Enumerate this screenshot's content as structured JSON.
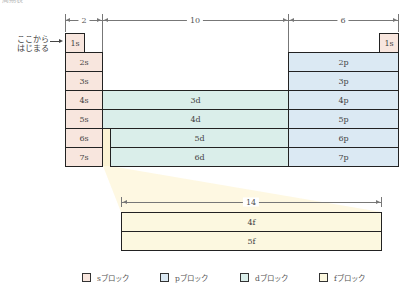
{
  "header": {
    "title": "周期表"
  },
  "dimensions": {
    "s_width": "2",
    "d_width": "10",
    "p_width": "6",
    "f_width": "14"
  },
  "start_label": {
    "line1": "ここから",
    "line2": "はじまる"
  },
  "s_block": [
    "1s",
    "2s",
    "3s",
    "4s",
    "5s",
    "6s",
    "7s"
  ],
  "p_block": {
    "top": "1s",
    "rows": [
      "2p",
      "3p",
      "4p",
      "5p",
      "6p",
      "7p"
    ]
  },
  "d_block": [
    "3d",
    "4d",
    "5d",
    "6d"
  ],
  "f_block": [
    "4f",
    "5f"
  ],
  "legend": [
    {
      "label": "sブロック",
      "color": "#f8e6de"
    },
    {
      "label": "pブロック",
      "color": "#dbe9f3"
    },
    {
      "label": "dブロック",
      "color": "#daeeea"
    },
    {
      "label": "fブロック",
      "color": "#fcf8e0"
    }
  ],
  "colors": {
    "s": "#f8e6de",
    "p": "#dbe9f3",
    "d": "#daeeea",
    "f": "#fcf8e0",
    "border": "#222222"
  }
}
